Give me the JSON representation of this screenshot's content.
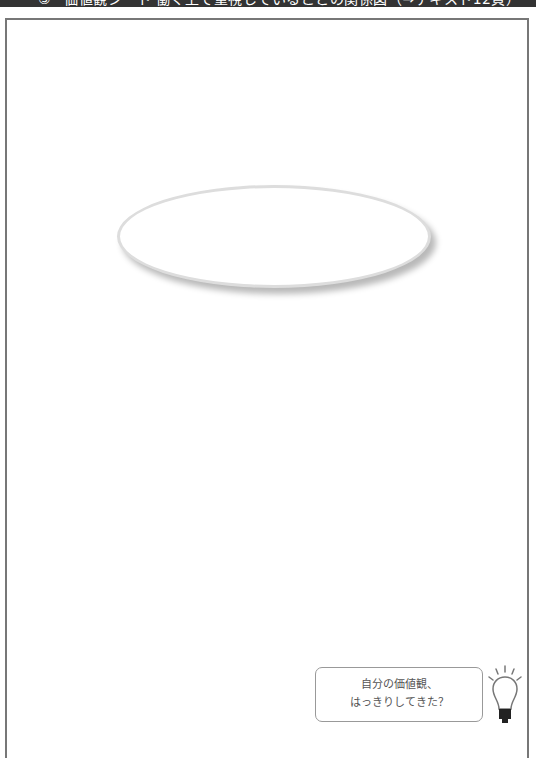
{
  "header": {
    "number": "③",
    "title": "価値観シート 働く上で重視していることの関係図（→テキスト12頁）"
  },
  "worksheet": {
    "ellipse_label": ""
  },
  "callout": {
    "line1": "自分の価値観、",
    "line2": "はっきりしてきた？",
    "icon": "lightbulb-icon"
  },
  "colors": {
    "header_bg": "#333333",
    "frame_border": "#777777",
    "ellipse_border": "#dddddd"
  }
}
